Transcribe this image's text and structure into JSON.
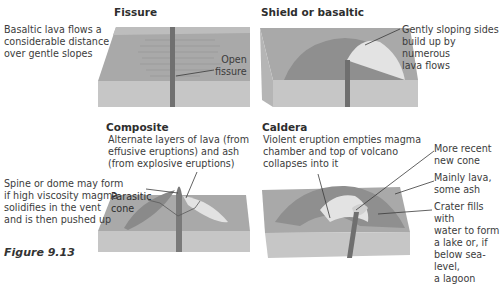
{
  "figure_label": "Figure 9.13",
  "colors": {
    "block_top": "#a9a9a9",
    "block_front": "#c6c6c6",
    "block_side": "#b5b5b5",
    "vent": "#6f6f6f",
    "cone_dark": "#8a8a8a",
    "cone_light": "#e2e2e2",
    "leader": "#3a3a3a"
  },
  "panels": {
    "fissure": {
      "title": "Fissure",
      "description": "Basaltic lava flows a\nconsiderable distance\nover gentle slopes",
      "labels": [
        "Open\nfissure"
      ]
    },
    "shield": {
      "title": "Shield or basaltic",
      "labels": [
        "Gently sloping sides\nbuild up by numerous\nlava flows"
      ]
    },
    "composite": {
      "title": "Composite",
      "labels": [
        "Alternate layers of lava (from\neffusive eruptions) and ash\n(from explosive eruptions)",
        "Spine or dome may form\nif high viscosity magma\nsolidifies in the vent\nand is then pushed up",
        "Parasitic\ncone"
      ]
    },
    "caldera": {
      "title": "Caldera",
      "labels": [
        "Violent eruption empties magma\nchamber and top of volcano\ncollapses into it",
        "More recent\nnew cone",
        "Mainly lava,\nsome ash",
        "Crater fills with\nwater to form\na lake or, if\nbelow sea-level,\na lagoon"
      ]
    }
  }
}
